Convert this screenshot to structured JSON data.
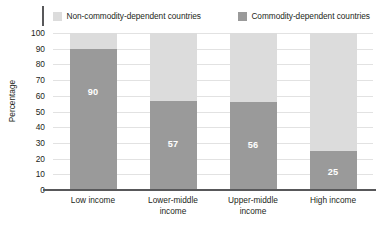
{
  "legend": {
    "items": [
      {
        "label": "Non-commodity-dependent countries",
        "swatch": "light-gray-swatch-icon",
        "color": "#dcdcdc"
      },
      {
        "label": "Commodity-dependent countries",
        "swatch": "dark-gray-swatch-icon",
        "color": "#9a9a9a"
      }
    ]
  },
  "axis": {
    "y_title": "Percentage",
    "y_ticks": [
      "100",
      "90",
      "80",
      "70",
      "60",
      "50",
      "40",
      "30",
      "20",
      "10",
      "0"
    ]
  },
  "chart_data": {
    "type": "bar",
    "subtype": "stacked-bar-100",
    "title": "",
    "subtitle": "",
    "xlabel": "",
    "ylabel": "Percentage",
    "ylim": [
      0,
      100
    ],
    "ytick_step": 10,
    "grid": true,
    "legend_position": "top",
    "categories": [
      "Low income",
      "Lower-middle income",
      "Upper-middle income",
      "High income"
    ],
    "category_lines": [
      [
        "Low income"
      ],
      [
        "Lower-middle",
        "income"
      ],
      [
        "Upper-middle",
        "income"
      ],
      [
        "High income"
      ]
    ],
    "series": [
      {
        "name": "Commodity-dependent countries",
        "color": "#9a9a9a",
        "values": [
          90,
          57,
          56,
          25
        ],
        "labels": [
          "90",
          "57",
          "56",
          "25"
        ]
      },
      {
        "name": "Non-commodity-dependent countries",
        "color": "#dcdcdc",
        "values": [
          10,
          43,
          44,
          75
        ],
        "labels": [
          "",
          "",
          "",
          ""
        ]
      }
    ]
  }
}
